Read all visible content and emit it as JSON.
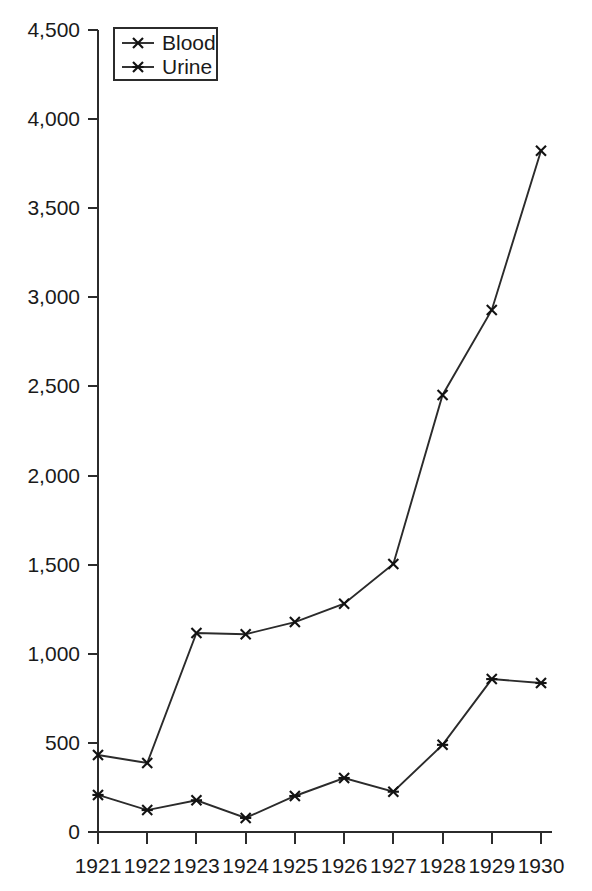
{
  "chart_data": {
    "type": "line",
    "title": "",
    "subtitle": "",
    "xlabel": "",
    "ylabel": "",
    "categories": [
      "1921",
      "1922",
      "1923",
      "1924",
      "1925",
      "1926",
      "1927",
      "1928",
      "1929",
      "1930"
    ],
    "series": [
      {
        "name": "Blood",
        "marker": "x-cross",
        "values": [
          432,
          387,
          1117,
          1110,
          1178,
          1281,
          1504,
          2452,
          2929,
          3822
        ]
      },
      {
        "name": "Urine",
        "marker": "six-point-asterisk",
        "values": [
          208,
          123,
          178,
          79,
          202,
          303,
          226,
          489,
          858,
          836
        ]
      }
    ],
    "ylim": [
      0,
      4500
    ],
    "yticks": [
      0,
      500,
      1000,
      1500,
      2000,
      2500,
      3000,
      3500,
      4000,
      4500
    ],
    "ytick_labels": [
      "0",
      "500",
      "1,000",
      "1,500",
      "2,000",
      "2,500",
      "3,000",
      "3,500",
      "4,000",
      "4,500"
    ],
    "xtick_labels": [
      "1921",
      "1922",
      "1923",
      "1924",
      "1925",
      "1926",
      "1927",
      "1928",
      "1929",
      "1930"
    ],
    "grid": false,
    "legend_position": "top-left",
    "legend_entries": [
      "Blood",
      "Urine"
    ],
    "colors": {
      "line": "#2b2b2b",
      "axis": "#2b2b2b",
      "text": "#1a1a1a",
      "background": "#ffffff"
    }
  }
}
